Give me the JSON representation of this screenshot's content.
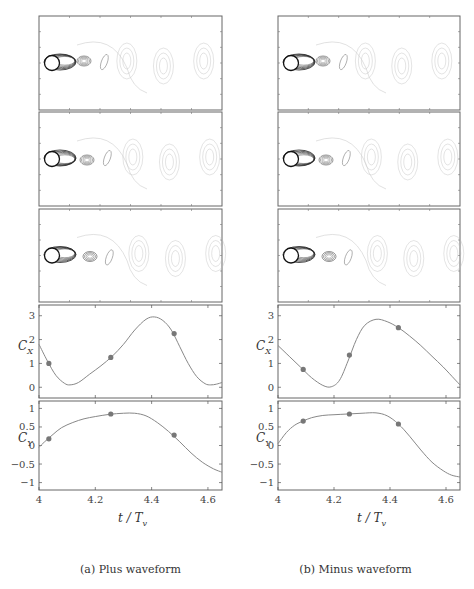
{
  "figure": {
    "subfigures": [
      {
        "id": "a",
        "caption": "(a) Plus waveform",
        "flow_panels": 3
      },
      {
        "id": "b",
        "caption": "(b) Minus waveform",
        "flow_panels": 3
      }
    ],
    "xlabel_var": "t / T",
    "xlabel_sub": "v",
    "cx_label": "C",
    "cx_sub": "X",
    "cy_label": "C",
    "cy_sub": "Y"
  },
  "chart_data": [
    {
      "type": "line",
      "title": "Plus waveform - C_X",
      "xlabel": "t/T_v",
      "ylabel": "C_X",
      "xlim": [
        4,
        4.65
      ],
      "ylim": [
        -0.45,
        3.45
      ],
      "xticks": [
        4,
        4.2,
        4.4,
        4.6
      ],
      "xtick_labels": [
        "4",
        "4.2",
        "4.4",
        "4.6"
      ],
      "yticks": [
        0,
        1,
        2,
        3
      ],
      "ytick_labels": [
        "0",
        "1",
        "2",
        "3"
      ],
      "x": [
        4.0,
        4.03,
        4.06,
        4.09,
        4.11,
        4.14,
        4.18,
        4.22,
        4.26,
        4.3,
        4.34,
        4.38,
        4.41,
        4.44,
        4.47,
        4.5,
        4.53,
        4.56,
        4.59,
        4.61,
        4.63,
        4.65
      ],
      "y": [
        1.8,
        1.1,
        0.5,
        0.17,
        0.1,
        0.2,
        0.55,
        0.9,
        1.3,
        1.8,
        2.4,
        2.85,
        2.95,
        2.8,
        2.4,
        1.7,
        1.0,
        0.45,
        0.15,
        0.1,
        0.13,
        0.2
      ],
      "markers": {
        "x": [
          4.035,
          4.255,
          4.48
        ],
        "y": [
          1.0,
          1.25,
          2.25
        ]
      }
    },
    {
      "type": "line",
      "title": "Plus waveform - C_Y",
      "xlabel": "t/T_v",
      "ylabel": "C_Y",
      "xlim": [
        4,
        4.65
      ],
      "ylim": [
        -1.2,
        1.2
      ],
      "xticks": [
        4,
        4.2,
        4.4,
        4.6
      ],
      "xtick_labels": [
        "4",
        "4.2",
        "4.4",
        "4.6"
      ],
      "yticks": [
        -1,
        -0.5,
        0,
        0.5,
        1
      ],
      "ytick_labels": [
        "−1",
        "−0.5",
        "0",
        "0.5",
        "1"
      ],
      "x": [
        4.0,
        4.02,
        4.05,
        4.08,
        4.12,
        4.16,
        4.2,
        4.25,
        4.3,
        4.34,
        4.38,
        4.42,
        4.46,
        4.5,
        4.54,
        4.58,
        4.62,
        4.65
      ],
      "y": [
        -0.05,
        0.1,
        0.3,
        0.48,
        0.62,
        0.72,
        0.78,
        0.84,
        0.87,
        0.87,
        0.8,
        0.62,
        0.38,
        0.1,
        -0.2,
        -0.45,
        -0.63,
        -0.72
      ],
      "markers": {
        "x": [
          4.035,
          4.255,
          4.48
        ],
        "y": [
          0.18,
          0.85,
          0.28
        ]
      }
    },
    {
      "type": "line",
      "title": "Minus waveform - C_X",
      "xlabel": "t/T_v",
      "ylabel": "C_X",
      "xlim": [
        4,
        4.65
      ],
      "ylim": [
        -0.45,
        3.45
      ],
      "xticks": [
        4,
        4.2,
        4.4,
        4.6
      ],
      "xtick_labels": [
        "4",
        "4.2",
        "4.4",
        "4.6"
      ],
      "yticks": [
        0,
        1,
        2,
        3
      ],
      "ytick_labels": [
        "0",
        "1",
        "2",
        "3"
      ],
      "x": [
        4.0,
        4.04,
        4.08,
        4.12,
        4.16,
        4.19,
        4.22,
        4.25,
        4.28,
        4.31,
        4.35,
        4.39,
        4.43,
        4.47,
        4.51,
        4.55,
        4.59,
        4.63,
        4.65
      ],
      "y": [
        1.75,
        1.3,
        0.85,
        0.4,
        0.08,
        0.02,
        0.3,
        1.1,
        2.0,
        2.6,
        2.85,
        2.75,
        2.5,
        2.15,
        1.75,
        1.3,
        0.85,
        0.35,
        0.1
      ],
      "markers": {
        "x": [
          4.09,
          4.255,
          4.43
        ],
        "y": [
          0.75,
          1.35,
          2.5
        ]
      }
    },
    {
      "type": "line",
      "title": "Minus waveform - C_Y",
      "xlabel": "t/T_v",
      "ylabel": "C_Y",
      "xlim": [
        4,
        4.65
      ],
      "ylim": [
        -1.2,
        1.2
      ],
      "xticks": [
        4,
        4.2,
        4.4,
        4.6
      ],
      "xtick_labels": [
        "4",
        "4.2",
        "4.4",
        "4.6"
      ],
      "yticks": [
        -1,
        -0.5,
        0,
        0.5,
        1
      ],
      "ytick_labels": [
        "−1",
        "−0.5",
        "0",
        "0.5",
        "1"
      ],
      "x": [
        4.0,
        4.03,
        4.06,
        4.09,
        4.12,
        4.16,
        4.2,
        4.25,
        4.3,
        4.35,
        4.39,
        4.43,
        4.47,
        4.51,
        4.55,
        4.59,
        4.62,
        4.65
      ],
      "y": [
        0.05,
        0.35,
        0.55,
        0.66,
        0.75,
        0.81,
        0.83,
        0.85,
        0.87,
        0.88,
        0.8,
        0.58,
        0.25,
        -0.12,
        -0.45,
        -0.68,
        -0.8,
        -0.85
      ],
      "markers": {
        "x": [
          4.09,
          4.255,
          4.43
        ],
        "y": [
          0.66,
          0.85,
          0.58
        ]
      }
    }
  ]
}
